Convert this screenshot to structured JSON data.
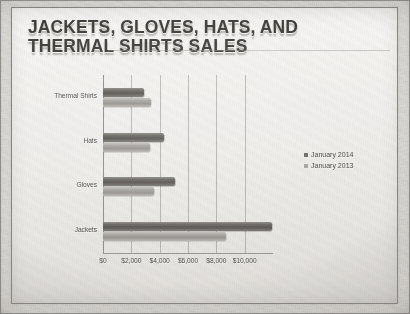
{
  "slide": {
    "title": "JACKETS, GLOVES, HATS, AND THERMAL SHIRTS SALES"
  },
  "chart_data": {
    "type": "bar",
    "orientation": "horizontal",
    "title": "JACKETS, GLOVES, HATS, AND THERMAL SHIRTS SALES",
    "xlabel": "",
    "ylabel": "",
    "categories": [
      "Thermal Shirts",
      "Hats",
      "Gloves",
      "Jackets"
    ],
    "series": [
      {
        "name": "January 2014",
        "color": "#6a6762",
        "values": [
          2900,
          4300,
          5100,
          11900
        ]
      },
      {
        "name": "January 2013",
        "color": "#a9a6a1",
        "values": [
          3400,
          3300,
          3600,
          8700
        ]
      }
    ],
    "xlim": [
      0,
      12000
    ],
    "xticks": [
      0,
      2000,
      4000,
      6000,
      8000,
      10000
    ],
    "xticklabels": [
      "$0",
      "$2,000",
      "$4,000",
      "$6,000",
      "$8,000",
      "$10,000"
    ],
    "grid": true,
    "legend_position": "right"
  }
}
